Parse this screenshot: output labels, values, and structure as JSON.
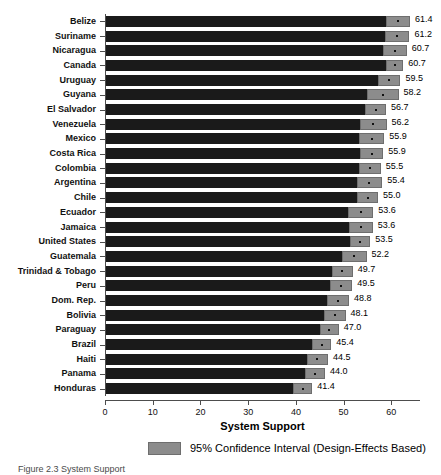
{
  "chart_data": {
    "type": "bar",
    "orientation": "horizontal",
    "title": "",
    "xlabel": "System Support",
    "ylabel": "",
    "xlim": [
      0,
      66
    ],
    "xticks": [
      0,
      10,
      20,
      30,
      40,
      50,
      60
    ],
    "xticklabels": [
      "0",
      "10",
      "20",
      "30",
      "40",
      "50",
      "60"
    ],
    "grid": false,
    "legend": {
      "position": "bottom-center",
      "entries": [
        {
          "label": "95% Confidence Interval (Design-Effects Based)",
          "color": "#8c8c8c"
        }
      ]
    },
    "bar_color": "#1a1a1a",
    "ci_color": "#8c8c8c",
    "categories": [
      "Belize",
      "Suriname",
      "Nicaragua",
      "Canada",
      "Uruguay",
      "Guyana",
      "El Salvador",
      "Venezuela",
      "Mexico",
      "Costa Rica",
      "Colombia",
      "Argentina",
      "Chile",
      "Ecuador",
      "Jamaica",
      "United States",
      "Guatemala",
      "Trinidad & Tobago",
      "Peru",
      "Dom. Rep.",
      "Bolivia",
      "Paraguay",
      "Brazil",
      "Haiti",
      "Panama",
      "Honduras"
    ],
    "values": [
      61.4,
      61.2,
      60.7,
      60.7,
      59.5,
      58.2,
      56.7,
      56.2,
      55.9,
      55.9,
      55.5,
      55.4,
      55.0,
      53.6,
      53.6,
      53.5,
      52.2,
      49.7,
      49.5,
      48.8,
      48.1,
      47.0,
      45.4,
      44.5,
      44.0,
      41.4
    ],
    "value_labels": [
      "61.4",
      "61.2",
      "60.7",
      "60.7",
      "59.5",
      "58.2",
      "56.7",
      "56.2",
      "55.9",
      "55.9",
      "55.5",
      "55.4",
      "55.0",
      "53.6",
      "53.6",
      "53.5",
      "52.2",
      "49.7",
      "49.5",
      "48.8",
      "48.1",
      "47.0",
      "45.4",
      "44.5",
      "44.0",
      "41.4"
    ],
    "ci_low": [
      58.9,
      58.6,
      58.2,
      58.9,
      57.1,
      54.9,
      54.5,
      53.4,
      53.3,
      53.5,
      53.2,
      52.7,
      52.8,
      51.0,
      51.1,
      51.4,
      49.6,
      47.5,
      47.2,
      46.5,
      45.8,
      45.0,
      43.4,
      42.3,
      41.9,
      39.4
    ],
    "ci_high": [
      63.9,
      63.8,
      63.2,
      62.5,
      61.9,
      61.5,
      58.9,
      59.0,
      58.5,
      58.3,
      57.8,
      58.1,
      57.2,
      56.2,
      56.1,
      55.6,
      54.8,
      51.9,
      51.8,
      51.1,
      50.4,
      49.0,
      47.4,
      46.7,
      46.1,
      43.4
    ]
  },
  "legend": {
    "ci_label": "95% Confidence Interval (Design-Effects Based)"
  },
  "axis": {
    "x_title": "System Support"
  },
  "caption": "Figure 2.3 System Support"
}
